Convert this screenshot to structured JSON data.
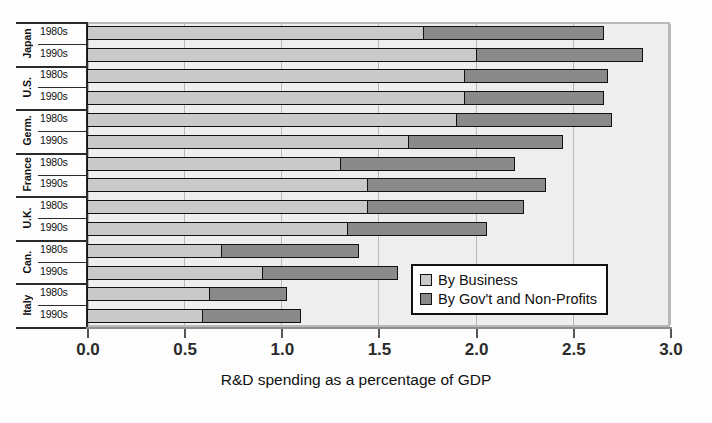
{
  "chart_data": {
    "type": "bar",
    "orientation": "horizontal",
    "stacked": true,
    "title": "",
    "xlabel": "R&D spending as a percentage of GDP",
    "ylabel": "",
    "xlim": [
      0.0,
      3.0
    ],
    "xticks": [
      "0.0",
      "0.5",
      "1.0",
      "1.5",
      "2.0",
      "2.5",
      "3.0"
    ],
    "xtick_values": [
      0.0,
      0.5,
      1.0,
      1.5,
      2.0,
      2.5,
      3.0
    ],
    "grid": "vertical",
    "legend_position": "lower-right-inside",
    "groups": [
      "Japan",
      "U.S.",
      "Germ.",
      "France",
      "U.K.",
      "Can.",
      "Italy"
    ],
    "subcategories": [
      "1980s",
      "1990s"
    ],
    "categories": [
      "Japan 1980s",
      "Japan 1990s",
      "U.S. 1980s",
      "U.S. 1990s",
      "Germ. 1980s",
      "Germ. 1990s",
      "France 1980s",
      "France 1990s",
      "U.K. 1980s",
      "U.K. 1990s",
      "Can. 1980s",
      "Can. 1990s",
      "Italy 1980s",
      "Italy 1990s"
    ],
    "series": [
      {
        "name": "By Business",
        "color": "#c9c9c9",
        "values": [
          1.73,
          2.0,
          1.94,
          1.94,
          1.9,
          1.65,
          1.3,
          1.44,
          1.44,
          1.34,
          0.69,
          0.9,
          0.63,
          0.59
        ]
      },
      {
        "name": "By Gov't and Non-Profits",
        "color": "#8a8a8a",
        "values": [
          0.93,
          0.86,
          0.74,
          0.72,
          0.8,
          0.8,
          0.9,
          0.92,
          0.81,
          0.72,
          0.71,
          0.7,
          0.4,
          0.51
        ]
      }
    ],
    "totals": [
      2.66,
      2.86,
      2.68,
      2.66,
      2.7,
      2.45,
      2.2,
      2.36,
      2.25,
      2.06,
      1.4,
      1.6,
      1.03,
      1.1
    ]
  },
  "axis": {
    "title": "R&D spending as a percentage of GDP",
    "ticks": [
      "0.0",
      "0.5",
      "1.0",
      "1.5",
      "2.0",
      "2.5",
      "3.0"
    ]
  },
  "rows": [
    {
      "group": "Japan",
      "decade": "1980s",
      "business": 1.73,
      "gov": 0.93,
      "total": 2.66
    },
    {
      "group": "Japan",
      "decade": "1990s",
      "business": 2.0,
      "gov": 0.86,
      "total": 2.86
    },
    {
      "group": "U.S.",
      "decade": "1980s",
      "business": 1.94,
      "gov": 0.74,
      "total": 2.68
    },
    {
      "group": "U.S.",
      "decade": "1990s",
      "business": 1.94,
      "gov": 0.72,
      "total": 2.66
    },
    {
      "group": "Germ.",
      "decade": "1980s",
      "business": 1.9,
      "gov": 0.8,
      "total": 2.7
    },
    {
      "group": "Germ.",
      "decade": "1990s",
      "business": 1.65,
      "gov": 0.8,
      "total": 2.45
    },
    {
      "group": "France",
      "decade": "1980s",
      "business": 1.3,
      "gov": 0.9,
      "total": 2.2
    },
    {
      "group": "France",
      "decade": "1990s",
      "business": 1.44,
      "gov": 0.92,
      "total": 2.36
    },
    {
      "group": "U.K.",
      "decade": "1980s",
      "business": 1.44,
      "gov": 0.81,
      "total": 2.25
    },
    {
      "group": "U.K.",
      "decade": "1990s",
      "business": 1.34,
      "gov": 0.72,
      "total": 2.06
    },
    {
      "group": "Can.",
      "decade": "1980s",
      "business": 0.69,
      "gov": 0.71,
      "total": 1.4
    },
    {
      "group": "Can.",
      "decade": "1990s",
      "business": 0.9,
      "gov": 0.7,
      "total": 1.6
    },
    {
      "group": "Italy",
      "decade": "1980s",
      "business": 0.63,
      "gov": 0.4,
      "total": 1.03
    },
    {
      "group": "Italy",
      "decade": "1990s",
      "business": 0.59,
      "gov": 0.51,
      "total": 1.1
    }
  ],
  "legend": {
    "items": [
      {
        "label": "By Business",
        "color": "#c9c9c9"
      },
      {
        "label": "By Gov't and Non-Profits",
        "color": "#8a8a8a"
      }
    ]
  },
  "colors": {
    "business": "#c9c9c9",
    "gov": "#8a8a8a",
    "plot_background": "#eeeeee",
    "gridline": "#b9b9b9",
    "bar_outline": "#111111"
  }
}
